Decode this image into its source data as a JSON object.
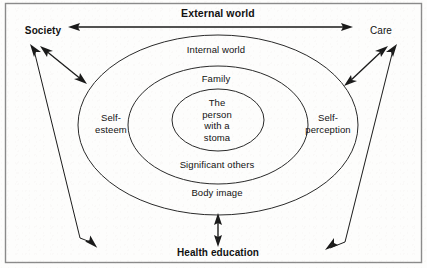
{
  "diagram": {
    "title_top": "External world",
    "outer_ellipse_label": "Internal world",
    "middle_ellipse_label_top": "Family",
    "middle_ellipse_label_bottom": "Significant others",
    "inner_ellipse_label": "The\nperson\nwith a\nstoma",
    "bottom_ellipse_label": "Body image",
    "left_inner_label": "Self-\nesteem",
    "right_inner_label": "Self-\nperception",
    "left_outer_label": "Society",
    "right_outer_label": "Care",
    "bottom_label": "Health education"
  },
  "colors": {
    "stroke": "#1a1a1a",
    "text": "#111111",
    "border": "#8a8a8a",
    "background": "#fdfdfc"
  }
}
